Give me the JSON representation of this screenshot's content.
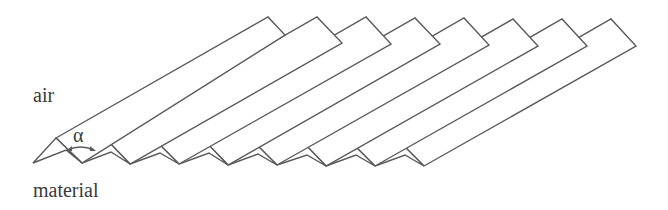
{
  "diagram": {
    "labels": {
      "air": "air",
      "material": "material",
      "angle": "α"
    },
    "ridge_count": 8,
    "colors": {
      "stroke": "#5a5a5a",
      "text": "#3a3a3a",
      "background": "#ffffff"
    }
  }
}
